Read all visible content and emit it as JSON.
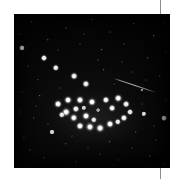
{
  "page": {
    "background_color": "#ffffff",
    "width": 185,
    "height": 179
  },
  "crop_marks": {
    "color": "#8d8d8d",
    "top_mark_label": "",
    "bottom_mark_label": ""
  },
  "plate": {
    "name": "star-cluster-plate",
    "caption": "",
    "background_color": "#030303",
    "x": 14,
    "y": 14,
    "width": 156,
    "height": 154
  },
  "trail": {
    "label": "",
    "x1": 100,
    "y1": 64,
    "x2": 142,
    "y2": 78,
    "color": "#e6e6e6"
  },
  "chart_data": {
    "type": "scatter",
    "title": "",
    "subtitle": "",
    "xlabel": "",
    "ylabel": "",
    "xlim": [
      0,
      156
    ],
    "ylim": [
      0,
      154
    ],
    "grid": false,
    "legend": "none",
    "annotations": [
      {
        "name": "satellite-trail",
        "x1": 100,
        "y1": 64,
        "x2": 142,
        "y2": 78
      }
    ],
    "series": [
      {
        "name": "cluster-members",
        "color": "#ffffff",
        "points": [
          {
            "x": 44,
            "y": 90,
            "r": 5.0,
            "b": 1.0
          },
          {
            "x": 54,
            "y": 86,
            "r": 5.0,
            "b": 1.0
          },
          {
            "x": 52,
            "y": 98,
            "r": 5.4,
            "b": 1.0
          },
          {
            "x": 62,
            "y": 95,
            "r": 4.6,
            "b": 0.96
          },
          {
            "x": 48,
            "y": 101,
            "r": 4.2,
            "b": 0.92
          },
          {
            "x": 66,
            "y": 86,
            "r": 5.0,
            "b": 1.0
          },
          {
            "x": 60,
            "y": 104,
            "r": 5.2,
            "b": 1.0
          },
          {
            "x": 72,
            "y": 102,
            "r": 5.0,
            "b": 1.0
          },
          {
            "x": 78,
            "y": 88,
            "r": 5.0,
            "b": 1.0
          },
          {
            "x": 80,
            "y": 106,
            "r": 4.2,
            "b": 0.9
          },
          {
            "x": 92,
            "y": 86,
            "r": 4.6,
            "b": 0.98
          },
          {
            "x": 98,
            "y": 94,
            "r": 4.4,
            "b": 0.95
          },
          {
            "x": 104,
            "y": 84,
            "r": 4.8,
            "b": 1.0
          },
          {
            "x": 112,
            "y": 90,
            "r": 4.4,
            "b": 0.95
          },
          {
            "x": 116,
            "y": 98,
            "r": 4.0,
            "b": 0.9
          },
          {
            "x": 110,
            "y": 104,
            "r": 4.6,
            "b": 0.98
          },
          {
            "x": 96,
            "y": 110,
            "r": 5.0,
            "b": 1.0
          },
          {
            "x": 86,
            "y": 114,
            "r": 5.4,
            "b": 1.0
          },
          {
            "x": 76,
            "y": 113,
            "r": 5.6,
            "b": 1.0
          },
          {
            "x": 66,
            "y": 112,
            "r": 5.0,
            "b": 1.0
          },
          {
            "x": 104,
            "y": 108,
            "r": 4.2,
            "b": 0.92
          },
          {
            "x": 70,
            "y": 94,
            "r": 3.2,
            "b": 0.8
          },
          {
            "x": 84,
            "y": 96,
            "r": 2.4,
            "b": 0.62
          }
        ]
      },
      {
        "name": "field-stars-bright",
        "color": "#f2f2f2",
        "points": [
          {
            "x": 8,
            "y": 34,
            "r": 3.6,
            "b": 0.95
          },
          {
            "x": 30,
            "y": 44,
            "r": 4.0,
            "b": 0.98
          },
          {
            "x": 42,
            "y": 54,
            "r": 4.2,
            "b": 1.0
          },
          {
            "x": 60,
            "y": 62,
            "r": 4.4,
            "b": 1.0
          },
          {
            "x": 72,
            "y": 70,
            "r": 4.6,
            "b": 1.0
          },
          {
            "x": 38,
            "y": 118,
            "r": 3.0,
            "b": 0.85
          },
          {
            "x": 130,
            "y": 100,
            "r": 3.2,
            "b": 0.88
          },
          {
            "x": 150,
            "y": 104,
            "r": 3.4,
            "b": 0.9
          },
          {
            "x": 128,
            "y": 76,
            "r": 2.0,
            "b": 0.55
          }
        ]
      },
      {
        "name": "field-stars-faint",
        "color": "#c8c8c8",
        "points": [
          {
            "x": 18,
            "y": 8,
            "r": 1.1,
            "b": 0.42
          },
          {
            "x": 52,
            "y": 14,
            "r": 1.0,
            "b": 0.38
          },
          {
            "x": 78,
            "y": 6,
            "r": 1.2,
            "b": 0.45
          },
          {
            "x": 96,
            "y": 18,
            "r": 1.0,
            "b": 0.36
          },
          {
            "x": 120,
            "y": 10,
            "r": 1.1,
            "b": 0.4
          },
          {
            "x": 140,
            "y": 22,
            "r": 1.2,
            "b": 0.44
          },
          {
            "x": 150,
            "y": 8,
            "r": 1.0,
            "b": 0.35
          },
          {
            "x": 6,
            "y": 20,
            "r": 1.0,
            "b": 0.34
          },
          {
            "x": 34,
            "y": 26,
            "r": 1.1,
            "b": 0.4
          },
          {
            "x": 66,
            "y": 30,
            "r": 1.0,
            "b": 0.36
          },
          {
            "x": 88,
            "y": 36,
            "r": 1.2,
            "b": 0.46
          },
          {
            "x": 110,
            "y": 30,
            "r": 1.0,
            "b": 0.35
          },
          {
            "x": 134,
            "y": 44,
            "r": 1.1,
            "b": 0.4
          },
          {
            "x": 152,
            "y": 38,
            "r": 1.0,
            "b": 0.34
          },
          {
            "x": 14,
            "y": 52,
            "r": 1.0,
            "b": 0.33
          },
          {
            "x": 24,
            "y": 66,
            "r": 1.1,
            "b": 0.38
          },
          {
            "x": 90,
            "y": 56,
            "r": 1.2,
            "b": 0.44
          },
          {
            "x": 118,
            "y": 58,
            "r": 1.0,
            "b": 0.34
          },
          {
            "x": 146,
            "y": 62,
            "r": 1.1,
            "b": 0.4
          },
          {
            "x": 8,
            "y": 78,
            "r": 1.0,
            "b": 0.33
          },
          {
            "x": 26,
            "y": 82,
            "r": 1.2,
            "b": 0.46
          },
          {
            "x": 122,
            "y": 118,
            "r": 1.1,
            "b": 0.4
          },
          {
            "x": 142,
            "y": 126,
            "r": 1.0,
            "b": 0.35
          },
          {
            "x": 20,
            "y": 104,
            "r": 1.1,
            "b": 0.38
          },
          {
            "x": 10,
            "y": 124,
            "r": 1.0,
            "b": 0.34
          },
          {
            "x": 52,
            "y": 130,
            "r": 1.1,
            "b": 0.4
          },
          {
            "x": 74,
            "y": 134,
            "r": 1.0,
            "b": 0.33
          },
          {
            "x": 96,
            "y": 128,
            "r": 1.2,
            "b": 0.44
          },
          {
            "x": 30,
            "y": 144,
            "r": 1.0,
            "b": 0.35
          },
          {
            "x": 62,
            "y": 148,
            "r": 1.1,
            "b": 0.38
          },
          {
            "x": 104,
            "y": 146,
            "r": 1.0,
            "b": 0.33
          },
          {
            "x": 136,
            "y": 142,
            "r": 1.1,
            "b": 0.4
          },
          {
            "x": 150,
            "y": 150,
            "r": 1.0,
            "b": 0.34
          },
          {
            "x": 16,
            "y": 136,
            "r": 1.0,
            "b": 0.32
          },
          {
            "x": 84,
            "y": 46,
            "r": 1.0,
            "b": 0.36
          },
          {
            "x": 44,
            "y": 36,
            "r": 1.0,
            "b": 0.33
          },
          {
            "x": 128,
            "y": 90,
            "r": 1.0,
            "b": 0.36
          },
          {
            "x": 140,
            "y": 112,
            "r": 1.0,
            "b": 0.34
          },
          {
            "x": 58,
            "y": 122,
            "r": 1.0,
            "b": 0.33
          },
          {
            "x": 100,
            "y": 70,
            "r": 1.0,
            "b": 0.32
          },
          {
            "x": 34,
            "y": 110,
            "r": 1.0,
            "b": 0.34
          },
          {
            "x": 152,
            "y": 86,
            "r": 1.0,
            "b": 0.36
          },
          {
            "x": 6,
            "y": 98,
            "r": 1.0,
            "b": 0.32
          },
          {
            "x": 118,
            "y": 134,
            "r": 1.0,
            "b": 0.33
          },
          {
            "x": 46,
            "y": 74,
            "r": 1.0,
            "b": 0.35
          },
          {
            "x": 108,
            "y": 48,
            "r": 1.0,
            "b": 0.33
          },
          {
            "x": 70,
            "y": 20,
            "r": 1.0,
            "b": 0.32
          },
          {
            "x": 132,
            "y": 66,
            "r": 1.0,
            "b": 0.34
          },
          {
            "x": 22,
            "y": 92,
            "r": 1.0,
            "b": 0.33
          },
          {
            "x": 86,
            "y": 140,
            "r": 1.0,
            "b": 0.32
          }
        ]
      }
    ]
  }
}
